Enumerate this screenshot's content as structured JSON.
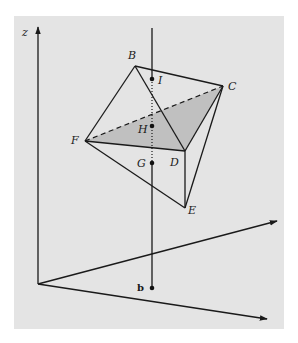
{
  "figure": {
    "type": "3d-geometry-diagram",
    "colors": {
      "panel": "#e4e4e4",
      "ink": "#1a1a1a",
      "shaded_face": "#b4b4b4"
    },
    "axes": {
      "z_label": "z",
      "axis_count": 3
    },
    "vertices": {
      "B": {
        "label": "B"
      },
      "C": {
        "label": "C"
      },
      "D": {
        "label": "D"
      },
      "E": {
        "label": "E"
      },
      "F": {
        "label": "F"
      }
    },
    "line_points": {
      "I": {
        "label": "I"
      },
      "H": {
        "label": "H"
      },
      "G": {
        "label": "G"
      },
      "b": {
        "label": "b"
      }
    },
    "edges": {
      "solid": [
        "B-C",
        "B-F",
        "B-D",
        "C-D",
        "C-E",
        "F-D",
        "F-E",
        "D-E"
      ],
      "dashed": [
        "F-C"
      ],
      "shaded_face": [
        "F",
        "C",
        "D"
      ]
    },
    "vertical_line": {
      "segments": [
        "solid above I",
        "dotted from I to G",
        "solid from G to b"
      ]
    }
  }
}
